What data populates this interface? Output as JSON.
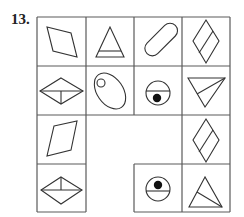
{
  "problem": {
    "number_label": "13.",
    "grid": {
      "rows": 4,
      "cols": 4,
      "cells": [
        {
          "row": 1,
          "col": 1,
          "shape": "parallelogram-rhombus-tilted"
        },
        {
          "row": 1,
          "col": 2,
          "shape": "triangle-with-horizontal-line-near-base"
        },
        {
          "row": 1,
          "col": 3,
          "shape": "diagonal-capsule"
        },
        {
          "row": 1,
          "col": 4,
          "shape": "rhombus-with-inner-diagonal-line"
        },
        {
          "row": 2,
          "col": 1,
          "shape": "rhombus-with-horizontal-and-vertical-half-line"
        },
        {
          "row": 2,
          "col": 2,
          "shape": "ellipse-with-small-circle"
        },
        {
          "row": 2,
          "col": 3,
          "shape": "circle-with-horizontal-line-dot-below"
        },
        {
          "row": 2,
          "col": 4,
          "shape": "inverted-triangle-with-inner-line"
        },
        {
          "row": 3,
          "col": 1,
          "shape": "parallelogram-rhombus-tilted"
        },
        {
          "row": 3,
          "col": 4,
          "shape": "rhombus-with-inner-diagonal-line"
        },
        {
          "row": 4,
          "col": 1,
          "shape": "rhombus-with-horizontal-and-vertical-half-line"
        },
        {
          "row": 4,
          "col": 3,
          "shape": "circle-with-horizontal-line-dot-above"
        },
        {
          "row": 4,
          "col": 4,
          "shape": "triangle-with-inner-line"
        }
      ],
      "empty_region": "rows 3-4, cols 2-3 (missing cells)"
    }
  }
}
